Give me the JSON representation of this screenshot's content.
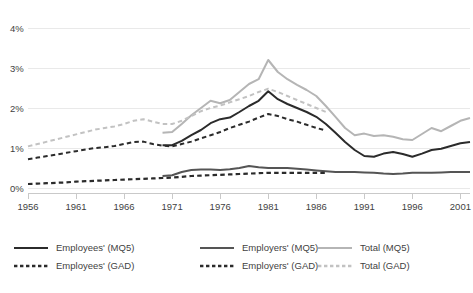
{
  "chart_data": {
    "type": "line",
    "title": "",
    "subtitle": "",
    "xlabel": "",
    "ylabel": "",
    "xlim": [
      1956,
      2002
    ],
    "ylim": [
      0,
      4
    ],
    "grid": true,
    "legend_position": "bottom",
    "y_ticks": [
      "0%",
      "1%",
      "2%",
      "3%",
      "4%"
    ],
    "y_tick_values": [
      0,
      1,
      2,
      3,
      4
    ],
    "x_ticks": [
      "1956",
      "1961",
      "1966",
      "1971",
      "1976",
      "1981",
      "1986",
      "1991",
      "1996",
      "2001"
    ],
    "x_tick_values": [
      1956,
      1961,
      1966,
      1971,
      1976,
      1981,
      1986,
      1991,
      1996,
      2001
    ],
    "colors": {
      "employees": "#2b2b2b",
      "employers": "#555555",
      "total": "#b5b5b5"
    },
    "series": [
      {
        "name": "Employees' (MQ5)",
        "style": "solid",
        "color": "#2b2b2b",
        "width": 2.0,
        "x": [
          1970,
          1971,
          1972,
          1973,
          1974,
          1975,
          1976,
          1977,
          1978,
          1979,
          1980,
          1981,
          1982,
          1983,
          1984,
          1985,
          1986,
          1987,
          1988,
          1989,
          1990,
          1991,
          1992,
          1993,
          1994,
          1995,
          1996,
          1997,
          1998,
          1999,
          2000,
          2001,
          2002
        ],
        "values": [
          1.07,
          1.07,
          1.18,
          1.32,
          1.45,
          1.62,
          1.72,
          1.76,
          1.9,
          2.05,
          2.18,
          2.42,
          2.22,
          2.1,
          2.0,
          1.9,
          1.78,
          1.6,
          1.38,
          1.15,
          0.95,
          0.8,
          0.78,
          0.86,
          0.9,
          0.85,
          0.78,
          0.86,
          0.95,
          0.98,
          1.05,
          1.12,
          1.15
        ]
      },
      {
        "name": "Employers' (MQ5)",
        "style": "solid",
        "color": "#555555",
        "width": 2.0,
        "x": [
          1970,
          1971,
          1972,
          1973,
          1974,
          1975,
          1976,
          1977,
          1978,
          1979,
          1980,
          1981,
          1982,
          1983,
          1984,
          1985,
          1986,
          1987,
          1988,
          1989,
          1990,
          1991,
          1992,
          1993,
          1994,
          1995,
          1996,
          1997,
          1998,
          1999,
          2000,
          2001,
          2002
        ],
        "values": [
          0.3,
          0.32,
          0.4,
          0.45,
          0.46,
          0.46,
          0.45,
          0.47,
          0.5,
          0.55,
          0.52,
          0.5,
          0.5,
          0.5,
          0.48,
          0.46,
          0.44,
          0.42,
          0.4,
          0.4,
          0.4,
          0.39,
          0.38,
          0.36,
          0.35,
          0.36,
          0.38,
          0.38,
          0.38,
          0.39,
          0.4,
          0.4,
          0.4
        ]
      },
      {
        "name": "Total (MQ5)",
        "style": "solid",
        "color": "#b5b5b5",
        "width": 2.0,
        "x": [
          1970,
          1971,
          1972,
          1973,
          1974,
          1975,
          1976,
          1977,
          1978,
          1979,
          1980,
          1981,
          1982,
          1983,
          1984,
          1985,
          1986,
          1987,
          1988,
          1989,
          1990,
          1991,
          1992,
          1993,
          1994,
          1995,
          1996,
          1997,
          1998,
          1999,
          2000,
          2001,
          2002
        ],
        "values": [
          1.38,
          1.4,
          1.6,
          1.82,
          2.0,
          2.18,
          2.12,
          2.2,
          2.4,
          2.6,
          2.72,
          3.2,
          2.9,
          2.72,
          2.58,
          2.45,
          2.3,
          2.05,
          1.78,
          1.5,
          1.32,
          1.36,
          1.3,
          1.32,
          1.28,
          1.22,
          1.2,
          1.35,
          1.5,
          1.42,
          1.55,
          1.68,
          1.75
        ]
      },
      {
        "name": "Employees' (GAD)",
        "style": "dashed",
        "color": "#2b2b2b",
        "width": 2.0,
        "x": [
          1956,
          1957,
          1958,
          1959,
          1960,
          1961,
          1962,
          1963,
          1964,
          1965,
          1966,
          1967,
          1968,
          1969,
          1970,
          1971,
          1972,
          1973,
          1974,
          1975,
          1976,
          1977,
          1978,
          1979,
          1980,
          1981,
          1982,
          1983,
          1984,
          1985,
          1986,
          1987
        ],
        "values": [
          0.72,
          0.76,
          0.8,
          0.84,
          0.88,
          0.92,
          0.96,
          1.0,
          1.02,
          1.05,
          1.1,
          1.15,
          1.16,
          1.1,
          1.06,
          1.04,
          1.1,
          1.16,
          1.24,
          1.32,
          1.4,
          1.5,
          1.58,
          1.66,
          1.76,
          1.85,
          1.8,
          1.72,
          1.66,
          1.58,
          1.5,
          1.44
        ]
      },
      {
        "name": "Employers' (GAD)",
        "style": "dashed",
        "color": "#2b2b2b",
        "width": 2.2,
        "x": [
          1956,
          1957,
          1958,
          1959,
          1960,
          1961,
          1962,
          1963,
          1964,
          1965,
          1966,
          1967,
          1968,
          1969,
          1970,
          1971,
          1972,
          1973,
          1974,
          1975,
          1976,
          1977,
          1978,
          1979,
          1980,
          1981,
          1982,
          1983,
          1984,
          1985,
          1986,
          1987
        ],
        "values": [
          0.1,
          0.11,
          0.12,
          0.13,
          0.14,
          0.16,
          0.17,
          0.18,
          0.19,
          0.2,
          0.21,
          0.22,
          0.23,
          0.24,
          0.25,
          0.26,
          0.28,
          0.3,
          0.31,
          0.32,
          0.33,
          0.34,
          0.35,
          0.36,
          0.37,
          0.38,
          0.38,
          0.38,
          0.38,
          0.38,
          0.38,
          0.38
        ]
      },
      {
        "name": "Total (GAD)",
        "style": "dashed",
        "color": "#c2c2c2",
        "width": 2.0,
        "x": [
          1956,
          1957,
          1958,
          1959,
          1960,
          1961,
          1962,
          1963,
          1964,
          1965,
          1966,
          1967,
          1968,
          1969,
          1970,
          1971,
          1972,
          1973,
          1974,
          1975,
          1976,
          1977,
          1978,
          1979,
          1980,
          1981,
          1982,
          1983,
          1984,
          1985,
          1986,
          1987
        ],
        "values": [
          1.04,
          1.1,
          1.16,
          1.22,
          1.28,
          1.34,
          1.4,
          1.46,
          1.5,
          1.54,
          1.6,
          1.68,
          1.72,
          1.66,
          1.6,
          1.6,
          1.68,
          1.8,
          1.92,
          2.0,
          2.06,
          2.14,
          2.22,
          2.3,
          2.4,
          2.48,
          2.4,
          2.3,
          2.2,
          2.1,
          2.0,
          1.9
        ]
      }
    ]
  },
  "legend": {
    "items": [
      {
        "label": "Employees' (MQ5)",
        "style": "solid",
        "color": "#2b2b2b",
        "col": 0,
        "row": 0
      },
      {
        "label": "Employees' (GAD)",
        "style": "dashed",
        "color": "#2b2b2b",
        "col": 0,
        "row": 1
      },
      {
        "label": "Employers' (MQ5)",
        "style": "solid",
        "color": "#555555",
        "col": 1,
        "row": 0
      },
      {
        "label": "Employers' (GAD)",
        "style": "dashed",
        "color": "#2b2b2b",
        "col": 1,
        "row": 1
      },
      {
        "label": "Total  (MQ5)",
        "style": "solid",
        "color": "#b5b5b5",
        "col": 2,
        "row": 0
      },
      {
        "label": "Total (GAD)",
        "style": "dashed",
        "color": "#c2c2c2",
        "col": 2,
        "row": 1
      }
    ]
  }
}
